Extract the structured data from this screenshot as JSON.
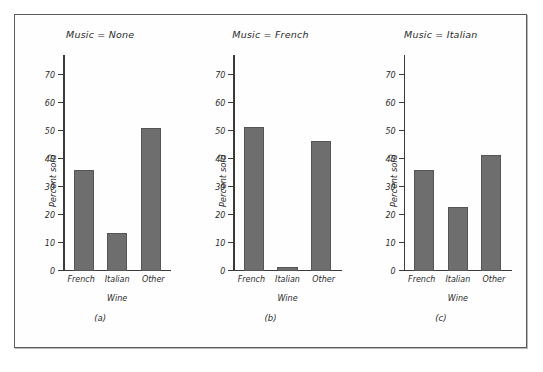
{
  "figure": {
    "background_color": "#fefefe",
    "border_color": "#5c5c5c",
    "bar_color": "#6e6e6e",
    "axis_color": "#3a3a3a"
  },
  "chart_data": {
    "type": "bar",
    "title": "",
    "xlabel": "Wine",
    "ylabel": "Percent sold",
    "ylim": [
      0,
      75
    ],
    "yticks": [
      0,
      10,
      20,
      30,
      40,
      50,
      60,
      70
    ],
    "ytick_labels": [
      "0",
      "10",
      "20",
      "30",
      "40",
      "50",
      "60",
      "70"
    ],
    "categories": [
      "French",
      "Italian",
      "Other"
    ],
    "grid": false,
    "legend": "none",
    "panels": [
      {
        "caption": "(a)",
        "title": "Music = None",
        "xlabel": "Wine",
        "ylabel": "Percent sold",
        "categories": [
          "French",
          "Italian",
          "Other"
        ],
        "values": [
          36,
          13.5,
          51
        ]
      },
      {
        "caption": "(b)",
        "title": "Music = French",
        "xlabel": "Wine",
        "ylabel": "Percent sold",
        "categories": [
          "French",
          "Italian",
          "Other"
        ],
        "values": [
          51.5,
          1.5,
          46.5
        ]
      },
      {
        "caption": "(c)",
        "title": "Music = Italian",
        "xlabel": "Wine",
        "ylabel": "Percent sold",
        "categories": [
          "French",
          "Italian",
          "Other"
        ],
        "values": [
          36,
          23,
          41.5
        ]
      }
    ]
  }
}
